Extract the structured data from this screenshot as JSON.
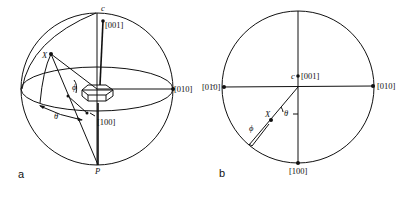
{
  "figure": {
    "panel_a": {
      "panel_label": "a",
      "labels": {
        "c001": "[001]",
        "c010": "[010]",
        "c100": "[100]",
        "x_point": "X",
        "pole": "P",
        "c_axis": "c",
        "theta": "θ",
        "phi": "ϕ"
      }
    },
    "panel_b": {
      "panel_label": "b",
      "labels": {
        "c001": "[001]",
        "c010": "[010]",
        "c0m10": "[01̄0]",
        "c100": "[100]",
        "x_point": "X",
        "c_axis": "c",
        "theta": "θ",
        "phi": "ϕ"
      }
    }
  }
}
